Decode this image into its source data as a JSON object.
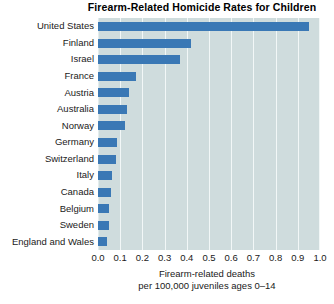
{
  "chart_data": {
    "type": "bar",
    "orientation": "horizontal",
    "title": "Firearm-Related Homicide Rates for Children",
    "xlabel_lines": [
      "Firearm-related deaths",
      "per 100,000 juveniles ages 0–14"
    ],
    "ylabel": "",
    "xlim": [
      0.0,
      1.0
    ],
    "xticks": [
      "0.0",
      "0.1",
      "0.2",
      "0.3",
      "0.4",
      "0.5",
      "0.6",
      "0.7",
      "0.8",
      "0.9",
      "1.0"
    ],
    "xtick_values": [
      0.0,
      0.1,
      0.2,
      0.3,
      0.4,
      0.5,
      0.6,
      0.7,
      0.8,
      0.9,
      1.0
    ],
    "grid": "vertical",
    "legend": "none",
    "categories": [
      "United States",
      "Finland",
      "Israel",
      "France",
      "Austria",
      "Australia",
      "Norway",
      "Germany",
      "Switzerland",
      "Italy",
      "Canada",
      "Belgium",
      "Sweden",
      "England and Wales"
    ],
    "values": [
      0.95,
      0.42,
      0.37,
      0.17,
      0.14,
      0.13,
      0.12,
      0.085,
      0.08,
      0.065,
      0.06,
      0.05,
      0.05,
      0.04
    ],
    "bar_color": "#3a78b5",
    "plot_background": "#cfdcdd",
    "gridline_color": "#f2f7f7"
  }
}
